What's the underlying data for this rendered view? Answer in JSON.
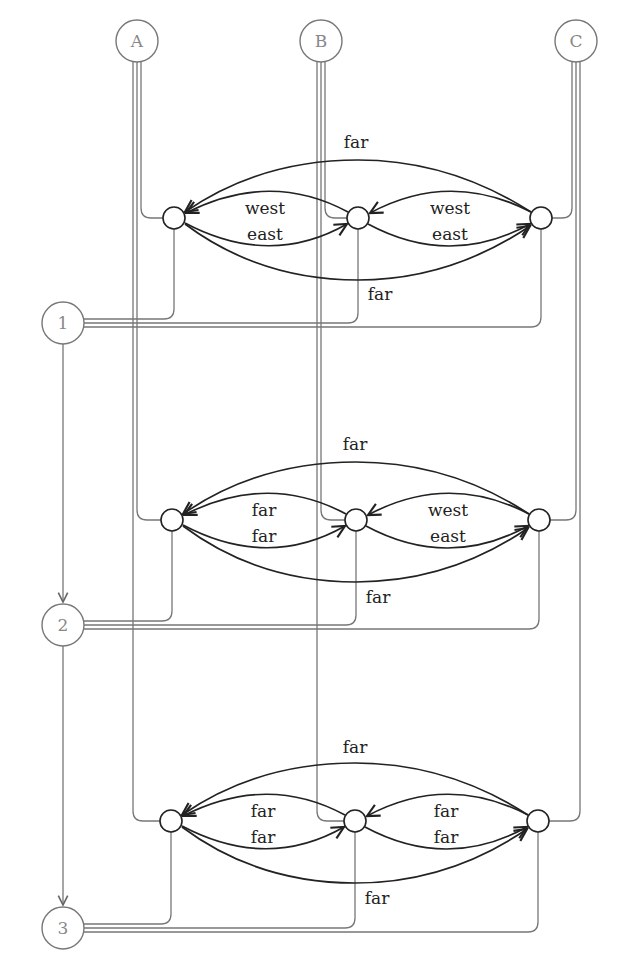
{
  "diagram": {
    "top_nodes": [
      {
        "id": "A",
        "label": "A",
        "x": 137,
        "y": 41
      },
      {
        "id": "B",
        "label": "B",
        "x": 321,
        "y": 41
      },
      {
        "id": "C",
        "label": "C",
        "x": 576,
        "y": 41
      }
    ],
    "side_nodes": [
      {
        "id": "1",
        "label": "1",
        "x": 63,
        "y": 323
      },
      {
        "id": "2",
        "label": "2",
        "x": 63,
        "y": 625
      },
      {
        "id": "3",
        "label": "3",
        "x": 63,
        "y": 928
      }
    ],
    "side_edges": [
      {
        "from": "1",
        "to": "2",
        "arrow": true
      },
      {
        "from": "2",
        "to": "3",
        "arrow": true
      }
    ],
    "clusters": [
      {
        "y": 218,
        "nodes_x": [
          174,
          358,
          541
        ],
        "top_far_label": "far",
        "bottom_far_label": "far",
        "left_pair": {
          "upper": "west",
          "lower": "east"
        },
        "right_pair": {
          "upper": "west",
          "lower": "east"
        }
      },
      {
        "y": 520,
        "nodes_x": [
          172,
          356,
          539
        ],
        "top_far_label": "far",
        "bottom_far_label": "far",
        "left_pair": {
          "upper": "far",
          "lower": "far"
        },
        "right_pair": {
          "upper": "west",
          "lower": "east"
        }
      },
      {
        "y": 821,
        "nodes_x": [
          171,
          355,
          538
        ],
        "top_far_label": "far",
        "bottom_far_label": "far",
        "left_pair": {
          "upper": "far",
          "lower": "far"
        },
        "right_pair": {
          "upper": "far",
          "lower": "far"
        }
      }
    ]
  }
}
